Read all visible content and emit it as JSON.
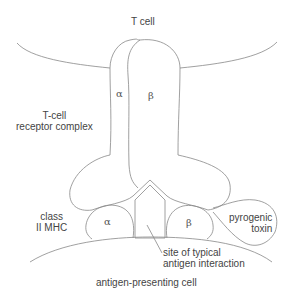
{
  "diagram": {
    "stroke_color": "#777777",
    "text_color": "#444444",
    "labels": {
      "t_cell": "T cell",
      "tcr_complex_line1": "T-cell",
      "tcr_complex_line2": "receptor complex",
      "tcr_alpha": "α",
      "tcr_beta": "β",
      "mhc_line1": "class",
      "mhc_line2": "II MHC",
      "mhc_alpha": "α",
      "mhc_beta": "β",
      "toxin_line1": "pyrogenic",
      "toxin_line2": "toxin",
      "site_line1": "site of typical",
      "site_line2": "antigen interaction",
      "apc": "antigen-presenting cell"
    }
  }
}
